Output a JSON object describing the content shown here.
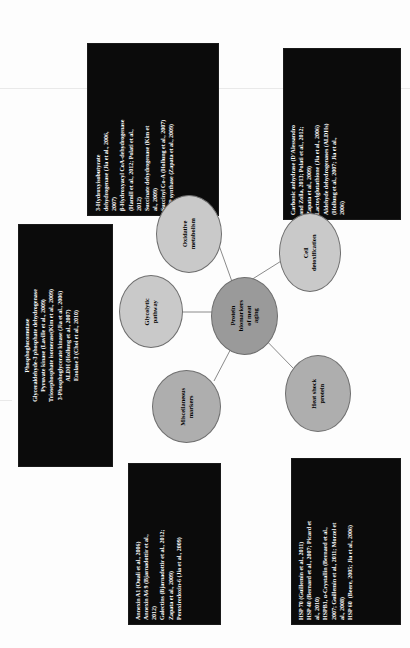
{
  "figure": {
    "type": "concept-map",
    "orientation": "rotated-90-ccw",
    "center": {
      "id": "center",
      "label": "Protein\nbiomarkers\nof meat\naging",
      "fill": "#9a9a9a"
    },
    "categories": [
      {
        "id": "oxidative-metabolism",
        "label": "Oxidative\nmetabolism",
        "fill": "#c9c9c9",
        "references": "3-Hydroxyisobutyrate\ndehydrogenase (Jia et al., 2006,\n2007)\nβ-Hydroxyacyl CoA-dehydrogenase\n(Hamill et al., 2012; Polati et al.,\n2012)\nSuccinate dehydrogenase (Kim et\nal., 2009)\nSuccinyl Co-A (Hollung et al., 2007)\nATP synthase (Zapata et al., 2009)"
      },
      {
        "id": "cell-detoxification",
        "label": "Cell\ndetoxification",
        "fill": "#c9c9c9",
        "references": "Carbonic anhydrase (D'Alessandro\nand Zolla, 2013; Polati et al., 2012;\nZapata et al., 2009)\nLactoylglutathione (Jia et al., 2006)\nAldehyde dehydrogenases (ALDHs)\n(Hollung et al., 2007; Jia et al.,\n2006)"
      },
      {
        "id": "glycolytic-pathway",
        "label": "Glycolytic\npathway",
        "fill": "#c9c9c9",
        "references": "Phosphoglucomutase\nGlyceraldehyde-3 phosphate dehydrogenase\nPyruvate kinase (Laville et al., 2009)\nTriosephosphate isomerase(Kim et al., 2009)\n3-Phosphoglycerate kinase (Jia et al., 2006)\nALDH (Hollung et al., 2007)\nEnolase 3 (Choi et al., 2010)"
      },
      {
        "id": "miscellaneous-markers",
        "label": "Miscellaneous\nmarkers",
        "fill": "#aeaeae",
        "references": "Annexin A1 (Ouali et al., 2006)\nAnnexin A6 9 (Bjarnadottir et al.,\n2012)\nGalectins (Bjarnadottir et al., 2012;\nZapata et al., 2009)\nPeroxiredoxin-6 (Jia et al., 2009)"
      },
      {
        "id": "heat-shock-protein",
        "label": "Heat shock\nprotein",
        "fill": "#aeaeae",
        "references": "HSP 70 (Guillemin et al., 2011)\nHSP 40 (Bernard et al., 2007; Picard et\nal., 2010)\nHSPB1, α-Crystallin (Bernard et al.,\n2007; Guillemin et al., 2011; Morzel et\nal., 2008)\nHSP 60  (Beere, 2005; Jia et al., 2006)"
      }
    ]
  }
}
